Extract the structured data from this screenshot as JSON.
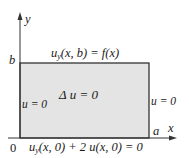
{
  "diagram": {
    "type": "boundary-value-problem-domain",
    "colors": {
      "region_fill": "#e4e4e4",
      "stroke": "#333333",
      "text": "#1a1a1a"
    },
    "axes": {
      "x_label": "x",
      "y_label": "y",
      "origin_label": "0",
      "x_mark_label": "a",
      "y_mark_label": "b"
    },
    "region": {
      "equation": "Δ u = 0"
    },
    "boundaries": {
      "top": {
        "u": "u",
        "sub": "y",
        "rest": "(x, b) = f(x)"
      },
      "left": "u = 0",
      "right": "u = 0",
      "bottom": {
        "u": "u",
        "sub": "y",
        "rest": "(x, 0) + 2 u(x, 0) = 0"
      }
    }
  }
}
